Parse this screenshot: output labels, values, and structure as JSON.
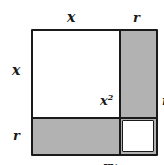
{
  "diagram": {
    "background_color": "#ffffff",
    "shaded_color": "#b2b2b2",
    "unshaded_color": "#ffffff",
    "stroke_color": "#1a1a1a",
    "dimension_labels": {
      "top_left": "x",
      "top_right": "r",
      "left_top": "x",
      "left_bottom": "r"
    },
    "regions": [
      {
        "name": "top-left",
        "label": "x",
        "exponent": "2",
        "shaded": false
      },
      {
        "name": "top-right",
        "label": "rx",
        "exponent": "",
        "shaded": true
      },
      {
        "name": "bottom-left",
        "label": "rx",
        "exponent": "",
        "shaded": true
      },
      {
        "name": "bottom-right",
        "label": "r",
        "exponent": "2",
        "shaded": false
      }
    ]
  }
}
